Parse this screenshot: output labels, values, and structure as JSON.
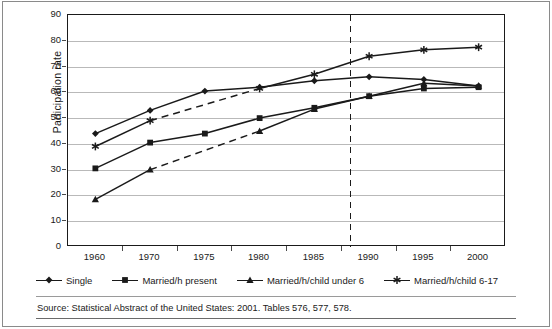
{
  "chart_data": {
    "type": "line",
    "title": "",
    "xlabel": "",
    "ylabel": "Participation rate",
    "categories": [
      "1960",
      "1970",
      "1975",
      "1980",
      "1985",
      "1990",
      "1995",
      "2000"
    ],
    "ylim": [
      0,
      90
    ],
    "ytick_step": 10,
    "yticks": [
      90,
      80,
      70,
      60,
      50,
      40,
      30,
      20,
      10,
      0
    ],
    "grid": true,
    "legend_position": "bottom",
    "annotations": [
      {
        "name": "projection-divider",
        "type": "vertical-dashed-line",
        "between": [
          "1985",
          "1990"
        ],
        "x_fraction": 0.66
      }
    ],
    "series": [
      {
        "name": "Single",
        "marker": "diamond",
        "x": [
          "1960",
          "1970",
          "1975",
          "1980",
          "1985",
          "1990",
          "1995",
          "2000"
        ],
        "values": [
          44,
          53,
          60.5,
          62,
          64.5,
          66,
          65,
          62.5
        ],
        "dashed_segments": []
      },
      {
        "name": "Married/h present",
        "marker": "square",
        "x": [
          "1960",
          "1970",
          "1975",
          "1980",
          "1985",
          "1990",
          "1995",
          "2000"
        ],
        "values": [
          30.5,
          40.5,
          44,
          50,
          54,
          58.5,
          61.5,
          62
        ],
        "dashed_segments": []
      },
      {
        "name": "Married/h/child under 6",
        "marker": "triangle",
        "x": [
          "1960",
          "1970",
          "1980",
          "1985",
          "1990",
          "1995",
          "2000"
        ],
        "values": [
          18.5,
          30,
          45,
          53.5,
          58.5,
          63.5,
          62.5
        ],
        "dashed_segments": [
          [
            "1970",
            "1980"
          ]
        ]
      },
      {
        "name": "Married/h/child 6-17",
        "marker": "asterisk",
        "x": [
          "1960",
          "1970",
          "1980",
          "1985",
          "1990",
          "1995",
          "2000"
        ],
        "values": [
          39,
          49,
          61.5,
          67,
          74,
          76.5,
          77.5
        ],
        "dashed_segments": [
          [
            "1970",
            "1980"
          ]
        ]
      }
    ]
  },
  "legend": {
    "items": [
      {
        "label": "Single",
        "marker": "diamond"
      },
      {
        "label": "Married/h present",
        "marker": "square"
      },
      {
        "label": "Married/h/child under 6",
        "marker": "triangle"
      },
      {
        "label": "Married/h/child 6-17",
        "marker": "asterisk"
      }
    ]
  },
  "source": {
    "text": "Source: Statistical Abstract of the United States: 2001. Tables 576, 577, 578."
  },
  "colors": {
    "line": "#1a1a1a",
    "grid": "#b9b9b9",
    "axis": "#1a1a1a",
    "background": "#ffffff",
    "text": "#1a1a1a"
  }
}
